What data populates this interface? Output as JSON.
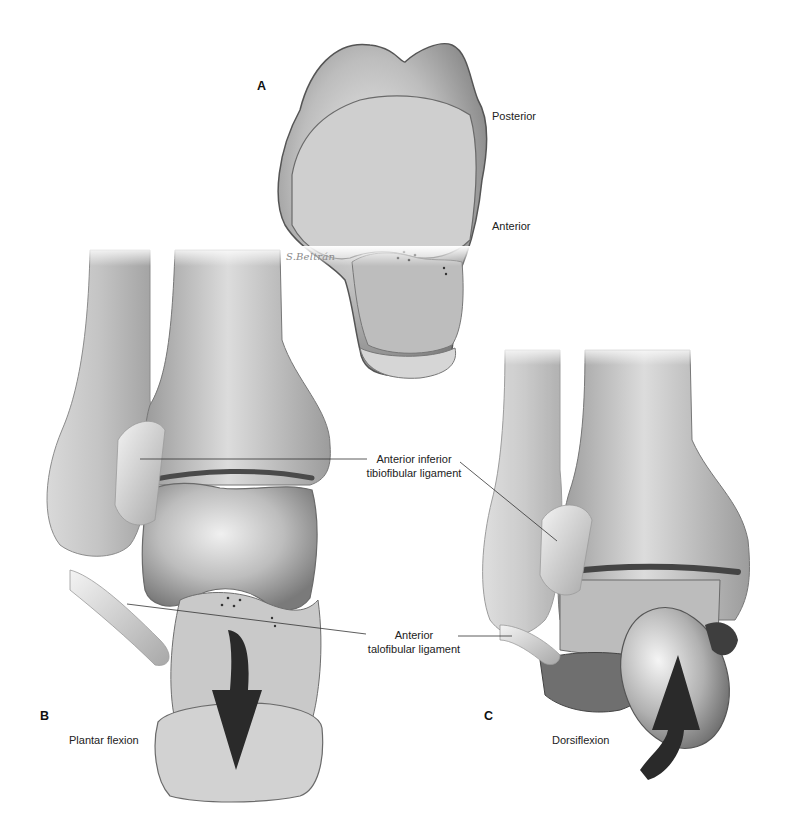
{
  "figure": {
    "signature": "S.Beltrán",
    "panels": [
      {
        "id": "A",
        "letter": "A",
        "labels": [
          "Posterior",
          "Anterior"
        ]
      },
      {
        "id": "B",
        "letter": "B",
        "caption": "Plantar flexion"
      },
      {
        "id": "C",
        "letter": "C",
        "caption": "Dorsiflexion"
      }
    ],
    "annotations": [
      {
        "line1": "Anterior inferior",
        "line2": "tibiofibular ligament"
      },
      {
        "line1": "Anterior",
        "line2": "talofibular ligament"
      }
    ],
    "colors": {
      "bone_light": "#e4e4e4",
      "bone_mid": "#b5b5b5",
      "bone_dark": "#6e6e6e",
      "arrow": "#2a2a2a",
      "leader_line": "#333333"
    }
  }
}
